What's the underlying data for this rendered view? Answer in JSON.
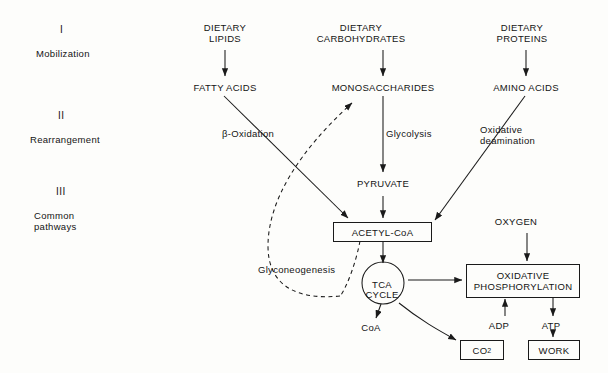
{
  "diagram": {
    "stages": [
      {
        "numeral": "I",
        "name": "Mobilization"
      },
      {
        "numeral": "II",
        "name": "Rearrangement"
      },
      {
        "numeral": "III",
        "name": "Common\npathways"
      }
    ],
    "nodes": {
      "dietary_lipids": "DIETARY\nLIPIDS",
      "dietary_carbohydrates": "DIETARY\nCARBOHYDRATES",
      "dietary_proteins": "DIETARY\nPROTEINS",
      "fatty_acids": "FATTY ACIDS",
      "monosaccharides": "MONOSACCHARIDES",
      "amino_acids": "AMINO ACIDS",
      "pyruvate": "PYRUVATE",
      "acetyl_coa": "ACETYL-CoA",
      "tca_cycle": "TCA\nCYCLE",
      "oxygen": "OXYGEN",
      "oxidative_phosphorylation": "OXIDATIVE\nPHOSPHORYLATION",
      "coa": "CoA",
      "adp": "ADP",
      "atp": "ATP",
      "co2": "CO",
      "co2_subscript": "2",
      "work": "WORK"
    },
    "edge_labels": {
      "beta_oxidation": "β-Oxidation",
      "glycolysis": "Glycolysis",
      "oxidative_deamination": "Oxidative\ndeamination",
      "glyconeogenesis": "Glyconeogenesis"
    },
    "colors": {
      "stroke": "#1a1a1a",
      "text": "#141414",
      "background": "#fdfdfb"
    }
  }
}
